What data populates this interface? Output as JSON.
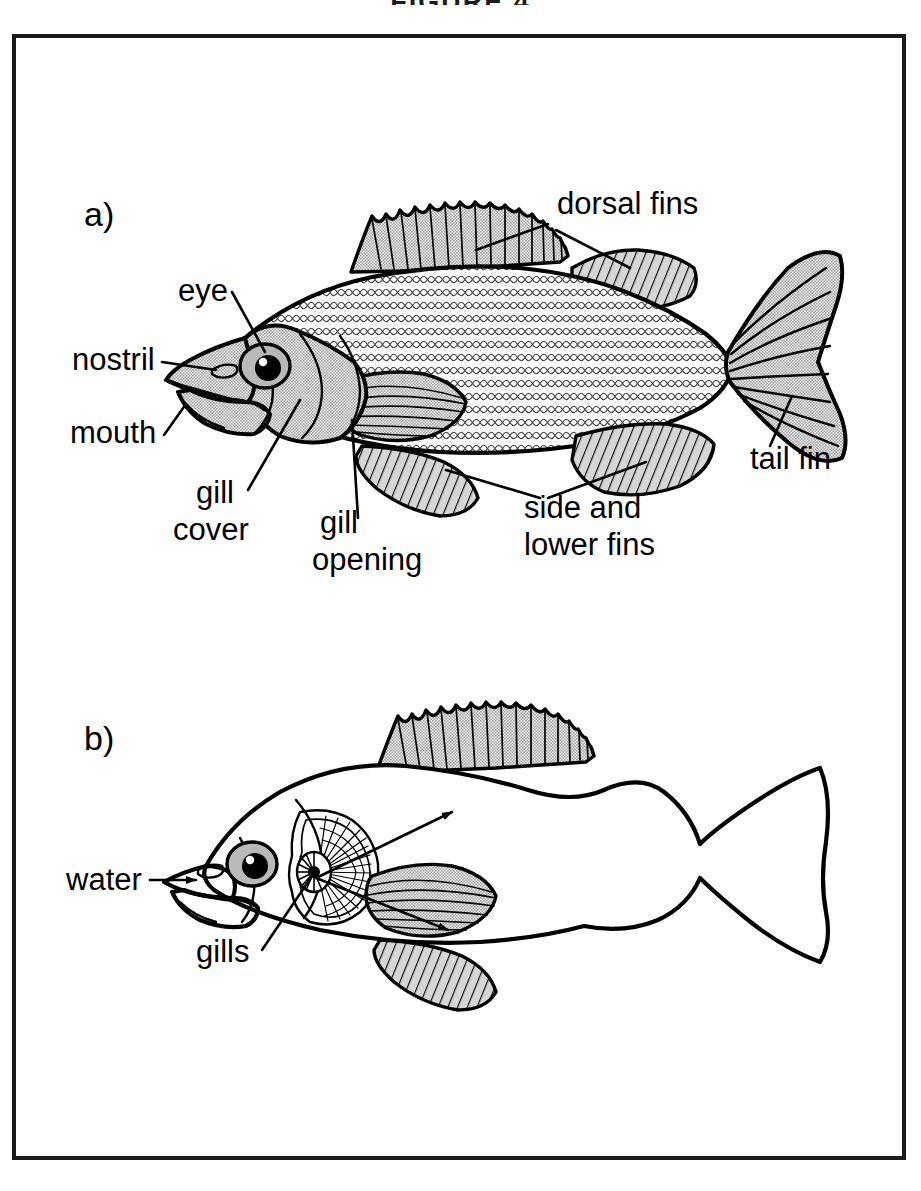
{
  "figure": {
    "title": "FIGURE 4",
    "frame": {
      "color": "#1a1a1a"
    }
  },
  "palette": {
    "ink": "#000000",
    "fin_gray": "#c9c9c9",
    "body_gray": "#c4c4c4",
    "head_gray": "#c9c9c9",
    "scale_gray": "#d8d8d8",
    "eye_iris": "#b9b9b9",
    "white": "#ffffff"
  },
  "panels": [
    {
      "id": "a",
      "letter": "a)",
      "caption": "External features of a bony fish",
      "body_shaded": true,
      "labels": [
        {
          "key": "eye",
          "text": "eye",
          "lines": [
            "eye"
          ],
          "x": 178,
          "y": 301,
          "anchor": "start"
        },
        {
          "key": "nostril",
          "text": "nostril",
          "lines": [
            "nostril"
          ],
          "x": 72,
          "y": 370,
          "anchor": "start"
        },
        {
          "key": "mouth",
          "text": "mouth",
          "lines": [
            "mouth"
          ],
          "x": 70,
          "y": 443,
          "anchor": "start"
        },
        {
          "key": "gill-cover",
          "text": "gill cover",
          "lines": [
            "gill",
            "cover"
          ],
          "x": 196,
          "y": 503,
          "anchor": "start"
        },
        {
          "key": "gill-opening",
          "text": "gill opening",
          "lines": [
            "gill",
            "opening"
          ],
          "x": 320,
          "y": 533,
          "anchor": "start"
        },
        {
          "key": "dorsal-fins",
          "text": "dorsal fins",
          "lines": [
            "dorsal fins"
          ],
          "x": 557,
          "y": 214,
          "anchor": "start"
        },
        {
          "key": "side-lower-fins",
          "text": "side and lower fins",
          "lines": [
            "side and",
            "lower fins"
          ],
          "x": 524,
          "y": 518,
          "anchor": "start"
        },
        {
          "key": "tail-fin",
          "text": "tail fin",
          "lines": [
            "tail fin"
          ],
          "x": 750,
          "y": 469,
          "anchor": "start"
        }
      ]
    },
    {
      "id": "b",
      "letter": "b)",
      "caption": "Water flow over the gills",
      "body_shaded": false,
      "labels": [
        {
          "key": "water",
          "text": "water",
          "lines": [
            "water"
          ],
          "x": 66,
          "y": 890,
          "anchor": "start"
        },
        {
          "key": "gills",
          "text": "gills",
          "lines": [
            "gills"
          ],
          "x": 196,
          "y": 962,
          "anchor": "start"
        }
      ]
    }
  ]
}
